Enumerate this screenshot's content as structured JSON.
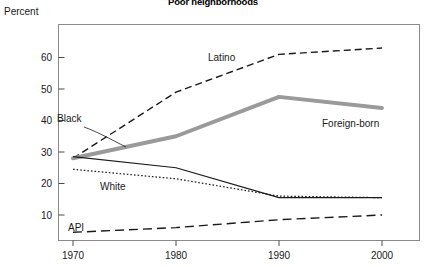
{
  "chart_data": {
    "type": "line",
    "title": "Poor neighborhoods",
    "ylabel": "Percent",
    "xlabel": "",
    "x": [
      1970,
      1980,
      1990,
      2000
    ],
    "xticklabels": [
      "1970",
      "1980",
      "1990",
      "2000"
    ],
    "yticklabels": [
      "10",
      "20",
      "30",
      "40",
      "50",
      "60"
    ],
    "ytickvalues": [
      10,
      20,
      30,
      40,
      50,
      60
    ],
    "ylim": [
      0,
      70
    ],
    "xlim": [
      1966,
      2005
    ],
    "grid": false,
    "legend_position": "inline-annotations",
    "series": [
      {
        "name": "Latino",
        "style": "dashed",
        "color": "#1a1a1a",
        "values": [
          28,
          49,
          61,
          63
        ]
      },
      {
        "name": "Foreign-born",
        "style": "thick-solid",
        "color": "#9a9a9a",
        "values": [
          28,
          35,
          47.5,
          44
        ]
      },
      {
        "name": "Black",
        "style": "thin-solid",
        "color": "#1a1a1a",
        "values": [
          28.5,
          25,
          15.5,
          15.5
        ]
      },
      {
        "name": "White",
        "style": "dotted",
        "color": "#1a1a1a",
        "values": [
          24.5,
          21.5,
          16,
          15.5
        ]
      },
      {
        "name": "API",
        "style": "long-dashed",
        "color": "#1a1a1a",
        "values": [
          4.5,
          6,
          8.5,
          10
        ]
      }
    ],
    "annotations": [
      {
        "text": "Latino",
        "x": 208,
        "y": 61
      },
      {
        "text": "Foreign-born",
        "x": 322,
        "y": 127
      },
      {
        "text": "Black",
        "x": 57,
        "y": 122
      },
      {
        "text": "White",
        "x": 100,
        "y": 190
      },
      {
        "text": "API",
        "x": 68,
        "y": 231
      }
    ]
  }
}
